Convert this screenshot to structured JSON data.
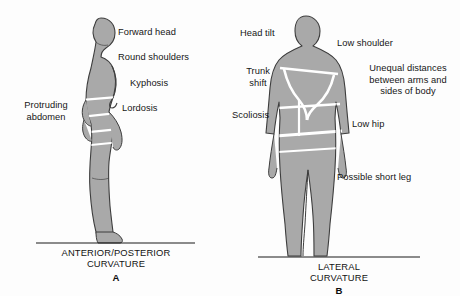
{
  "figure": {
    "type": "medical-illustration",
    "background_color": "#fdfdfd",
    "silhouette_fill": "#a9a9a9",
    "silhouette_stroke": "#3d3d3d",
    "marker_line_color": "#ffffff",
    "baseline_color": "#1a1a1a",
    "text_color": "#161616"
  },
  "panels": [
    {
      "id": "A",
      "letter": "A",
      "caption": "ANTERIOR/POSTERIOR\nCURVATURE",
      "view": "lateral-side-view",
      "labels": [
        {
          "name": "forward-head",
          "text": "Forward head",
          "align": "left",
          "x": 118,
          "y": 27
        },
        {
          "name": "round-shoulders",
          "text": "Round shoulders",
          "align": "left",
          "x": 118,
          "y": 52
        },
        {
          "name": "kyphosis",
          "text": "Kyphosis",
          "align": "left",
          "x": 130,
          "y": 78
        },
        {
          "name": "lordosis",
          "text": "Lordosis",
          "align": "left",
          "x": 122,
          "y": 103
        },
        {
          "name": "protruding-abdomen",
          "text": "Protruding\nabdomen",
          "align": "center",
          "x": 14,
          "y": 100
        }
      ]
    },
    {
      "id": "B",
      "letter": "B",
      "caption": "LATERAL\nCURVATURE",
      "view": "posterior-back-view",
      "labels": [
        {
          "name": "head-tilt",
          "text": "Head tilt",
          "align": "left",
          "x": 240,
          "y": 28
        },
        {
          "name": "trunk-shift",
          "text": "Trunk\nshift",
          "align": "center",
          "x": 238,
          "y": 66
        },
        {
          "name": "scoliosis",
          "text": "Scoliosis",
          "align": "left",
          "x": 232,
          "y": 110
        },
        {
          "name": "low-shoulder",
          "text": "Low shoulder",
          "align": "left",
          "x": 337,
          "y": 38
        },
        {
          "name": "unequal-distances",
          "text": "Unequal distances\nbetween arms and\nsides of body",
          "align": "center",
          "x": 358,
          "y": 63
        },
        {
          "name": "low-hip",
          "text": "Low hip",
          "align": "left",
          "x": 352,
          "y": 119
        },
        {
          "name": "possible-short-leg",
          "text": "Possible short leg",
          "align": "left",
          "x": 337,
          "y": 172
        }
      ]
    }
  ]
}
